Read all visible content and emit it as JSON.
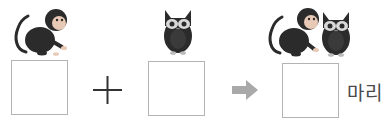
{
  "problem": {
    "terms": [
      {
        "animal": "monkey",
        "icon": "monkey-icon",
        "answer": ""
      },
      {
        "animal": "owl",
        "icon": "owl-icon",
        "answer": ""
      }
    ],
    "operator": "+",
    "result": {
      "icons": [
        "monkey-icon",
        "owl-icon"
      ],
      "answer": "",
      "unit": "마리"
    }
  },
  "colors": {
    "animal": "#2b2b2b",
    "box_border": "#b4b4b4",
    "arrow": "#a9a9a9",
    "plus": "#333333"
  }
}
